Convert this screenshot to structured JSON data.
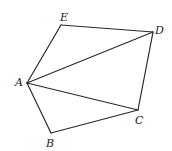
{
  "diagram": {
    "type": "geometry-figure",
    "points": {
      "A": {
        "x": 27,
        "y": 83,
        "label": "A",
        "lx": 15,
        "ly": 86
      },
      "B": {
        "x": 51,
        "y": 133,
        "label": "B",
        "lx": 46,
        "ly": 147
      },
      "C": {
        "x": 138,
        "y": 110,
        "label": "C",
        "lx": 135,
        "ly": 124
      },
      "D": {
        "x": 153,
        "y": 32,
        "label": "D",
        "lx": 155,
        "ly": 34
      },
      "E": {
        "x": 61,
        "y": 25,
        "label": "E",
        "lx": 60,
        "ly": 21
      }
    },
    "edges": [
      [
        "A",
        "B"
      ],
      [
        "B",
        "C"
      ],
      [
        "C",
        "D"
      ],
      [
        "D",
        "E"
      ],
      [
        "E",
        "A"
      ],
      [
        "A",
        "D"
      ],
      [
        "A",
        "C"
      ]
    ],
    "colors": {
      "stroke": "#2a2a2a",
      "label": "#222222",
      "background": "#ffffff"
    }
  }
}
